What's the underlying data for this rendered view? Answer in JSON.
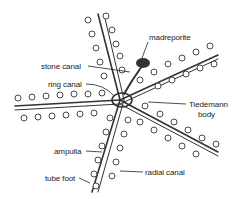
{
  "diagram": {
    "labels": {
      "madreporite": "madreporite",
      "stone_canal": "stone canal",
      "ring_canal": "ring canal",
      "tiedemann_line1": "Tiedemann",
      "tiedemann_line2": "body",
      "ampulla": "ampulla",
      "tube_foot": "tube foot",
      "radial_canal": "radial canal"
    },
    "colors": {
      "ink": "#222222",
      "background": "#ffffff"
    }
  }
}
